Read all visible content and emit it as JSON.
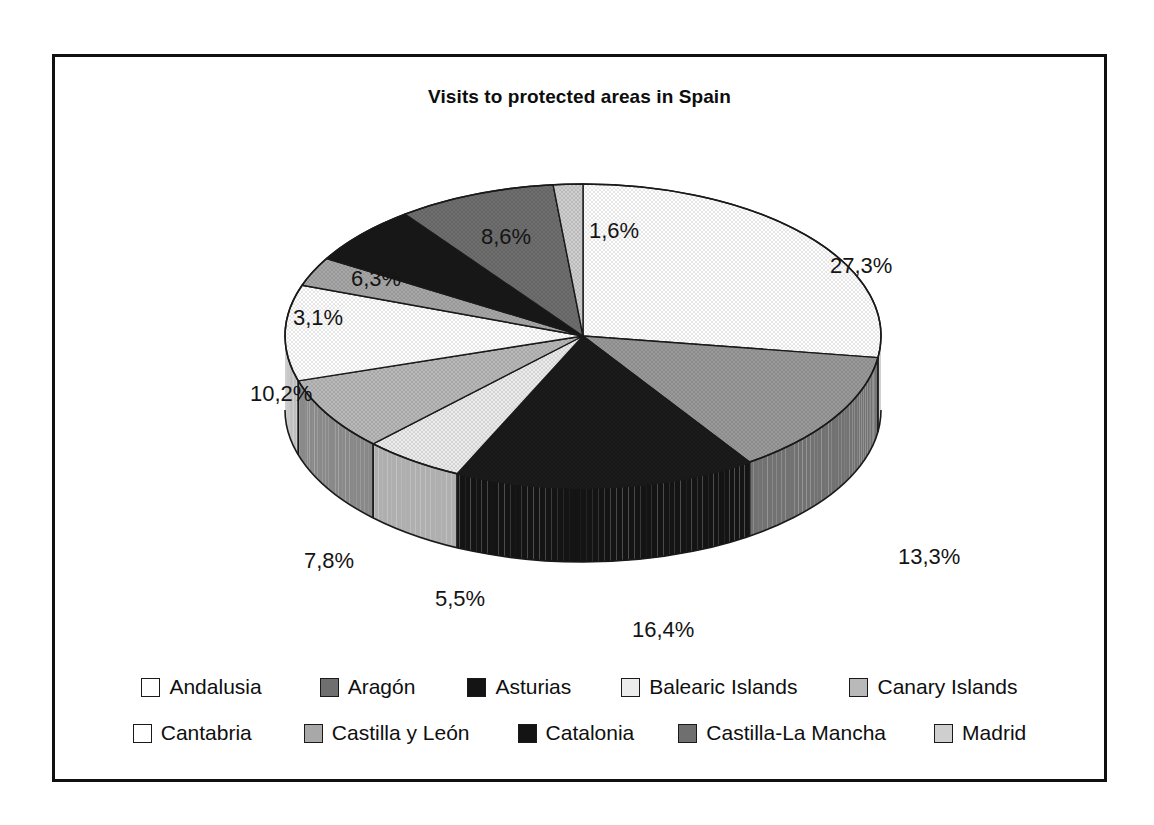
{
  "chart": {
    "title": "Visits to protected areas in Spain",
    "frame_border_color": "#101010",
    "background_color": "#ffffff"
  },
  "chart_data": {
    "type": "pie",
    "title": "Visits to protected areas in Spain",
    "style": "3d-exploded-disc",
    "decimal_separator": ",",
    "legend_position": "bottom",
    "grid": false,
    "categories": [
      "Andalusia",
      "Aragón",
      "Asturias",
      "Balearic Islands",
      "Canary Islands",
      "Cantabria",
      "Castilla y León",
      "Catalonia",
      "Castilla-La Mancha",
      "Madrid"
    ],
    "values": [
      27.3,
      13.3,
      16.4,
      5.5,
      7.8,
      10.2,
      3.1,
      6.3,
      8.6,
      1.6
    ],
    "labels": [
      "27,3%",
      "13,3%",
      "16,4%",
      "5,5%",
      "7,8%",
      "10,2%",
      "3,1%",
      "6,3%",
      "8,6%",
      "1,6%"
    ],
    "colors": [
      "#ffffff",
      "#9a9a9a",
      "#1b1b1b",
      "#ececec",
      "#b9b9b9",
      "#ffffff",
      "#a8a8a8",
      "#181818",
      "#6f6f6f",
      "#cfcfcf"
    ],
    "slices": [
      {
        "name": "Andalusia",
        "value": 27.3,
        "label": "27,3%",
        "color": "#ffffff"
      },
      {
        "name": "Aragón",
        "value": 13.3,
        "label": "13,3%",
        "color": "#9a9a9a"
      },
      {
        "name": "Asturias",
        "value": 16.4,
        "label": "16,4%",
        "color": "#1b1b1b"
      },
      {
        "name": "Balearic Islands",
        "value": 5.5,
        "label": "5,5%",
        "color": "#ececec"
      },
      {
        "name": "Canary Islands",
        "value": 7.8,
        "label": "7,8%",
        "color": "#b9b9b9"
      },
      {
        "name": "Cantabria",
        "value": 10.2,
        "label": "10,2%",
        "color": "#ffffff"
      },
      {
        "name": "Castilla y León",
        "value": 3.1,
        "label": "3,1%",
        "color": "#a8a8a8"
      },
      {
        "name": "Catalonia",
        "value": 6.3,
        "label": "6,3%",
        "color": "#181818"
      },
      {
        "name": "Castilla-La Mancha",
        "value": 8.6,
        "label": "8,6%",
        "color": "#6f6f6f"
      },
      {
        "name": "Madrid",
        "value": 1.6,
        "label": "1,6%",
        "color": "#cfcfcf"
      }
    ]
  },
  "labels_positions": [
    {
      "text": "27,3%",
      "x": 775,
      "y": 196
    },
    {
      "text": "13,3%",
      "x": 843,
      "y": 487
    },
    {
      "text": "16,4%",
      "x": 577,
      "y": 560
    },
    {
      "text": "5,5%",
      "x": 380,
      "y": 529
    },
    {
      "text": "7,8%",
      "x": 249,
      "y": 491
    },
    {
      "text": "10,2%",
      "x": 195,
      "y": 324
    },
    {
      "text": "3,1%",
      "x": 238,
      "y": 248
    },
    {
      "text": "6,3%",
      "x": 296,
      "y": 209
    },
    {
      "text": "8,6%",
      "x": 426,
      "y": 167
    },
    {
      "text": "1,6%",
      "x": 534,
      "y": 161
    }
  ],
  "legend": {
    "rows": [
      [
        {
          "label": "Andalusia",
          "color": "#ffffff"
        },
        {
          "label": "Aragón",
          "color": "#6f6f6f"
        },
        {
          "label": "Asturias",
          "color": "#141414"
        },
        {
          "label": "Balearic Islands",
          "color": "#ececec"
        },
        {
          "label": "Canary Islands",
          "color": "#b9b9b9"
        }
      ],
      [
        {
          "label": "Cantabria",
          "color": "#ffffff"
        },
        {
          "label": "Castilla y León",
          "color": "#a8a8a8"
        },
        {
          "label": "Catalonia",
          "color": "#141414"
        },
        {
          "label": "Castilla-La Mancha",
          "color": "#6f6f6f"
        },
        {
          "label": "Madrid",
          "color": "#cfcfcf"
        }
      ]
    ]
  }
}
